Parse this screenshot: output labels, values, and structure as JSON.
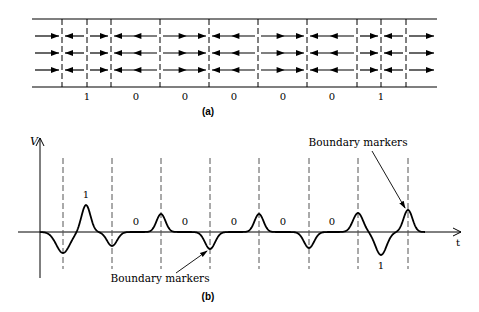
{
  "panel_a": {
    "caption": "(a)",
    "strip": {
      "x0": 32,
      "x1": 437,
      "top_y": 19,
      "bottom_y": 87
    },
    "boundaries_x": [
      62,
      87,
      111,
      160,
      209,
      258,
      307,
      357,
      381,
      406
    ],
    "arrow_rows_y": [
      36,
      53,
      70
    ],
    "cells": [
      {
        "x0": 32,
        "x1": 62,
        "dir": "right",
        "double": false
      },
      {
        "x0": 62,
        "x1": 87,
        "dir": "left",
        "double": false
      },
      {
        "x0": 87,
        "x1": 111,
        "dir": "right",
        "double": false
      },
      {
        "x0": 111,
        "x1": 160,
        "dir": "left",
        "double": true
      },
      {
        "x0": 160,
        "x1": 209,
        "dir": "right",
        "double": true
      },
      {
        "x0": 209,
        "x1": 258,
        "dir": "left",
        "double": true
      },
      {
        "x0": 258,
        "x1": 307,
        "dir": "right",
        "double": true
      },
      {
        "x0": 307,
        "x1": 357,
        "dir": "left",
        "double": true
      },
      {
        "x0": 357,
        "x1": 381,
        "dir": "right",
        "double": false
      },
      {
        "x0": 381,
        "x1": 406,
        "dir": "left",
        "double": false
      },
      {
        "x0": 406,
        "x1": 437,
        "dir": "right",
        "double": false
      }
    ],
    "bit_labels": [
      {
        "x": 87,
        "text": "1"
      },
      {
        "x": 136,
        "text": "0"
      },
      {
        "x": 185,
        "text": "0"
      },
      {
        "x": 234,
        "text": "0"
      },
      {
        "x": 283,
        "text": "0"
      },
      {
        "x": 332,
        "text": "0"
      },
      {
        "x": 381,
        "text": "1"
      }
    ]
  },
  "panel_b": {
    "caption": "(b)",
    "y_axis_label": "V",
    "x_axis_label": "t",
    "baseline_y": 232,
    "boundaries_x": [
      63,
      112,
      161,
      210,
      259,
      309,
      358,
      408
    ],
    "pulses": [
      {
        "x": 63,
        "peak_y": 253,
        "width": 12
      },
      {
        "x": 86,
        "peak_y": 205,
        "width": 8
      },
      {
        "x": 112,
        "peak_y": 246,
        "width": 9
      },
      {
        "x": 161,
        "peak_y": 214,
        "width": 8
      },
      {
        "x": 210,
        "peak_y": 249,
        "width": 9
      },
      {
        "x": 259,
        "peak_y": 214,
        "width": 8
      },
      {
        "x": 309,
        "peak_y": 248,
        "width": 9
      },
      {
        "x": 358,
        "peak_y": 213,
        "width": 9
      },
      {
        "x": 381,
        "peak_y": 255,
        "width": 10
      },
      {
        "x": 408,
        "peak_y": 210,
        "width": 8
      }
    ],
    "bit_labels": [
      {
        "x": 86,
        "y": 198,
        "text": "1"
      },
      {
        "x": 136,
        "y": 225,
        "text": "0"
      },
      {
        "x": 185,
        "y": 225,
        "text": "0"
      },
      {
        "x": 234,
        "y": 225,
        "text": "0"
      },
      {
        "x": 283,
        "y": 225,
        "text": "0"
      },
      {
        "x": 332,
        "y": 225,
        "text": "0"
      },
      {
        "x": 381,
        "y": 269,
        "text": "1"
      }
    ],
    "annotations": [
      {
        "text": "Boundary markers",
        "x": 160,
        "y": 282,
        "arrow_from": [
          176,
          273
        ],
        "arrow_to": [
          207,
          251
        ]
      },
      {
        "text": "Boundary markers",
        "x": 358,
        "y": 146,
        "arrow_from": [
          372,
          151
        ],
        "arrow_to": [
          405,
          208
        ]
      }
    ]
  }
}
